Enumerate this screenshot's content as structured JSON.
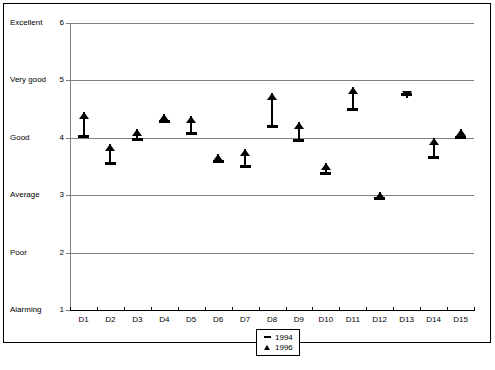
{
  "chart_data": {
    "type": "scatter",
    "title": "",
    "xlabel": "",
    "ylabel": "",
    "ylim": [
      1,
      6
    ],
    "xlim_categories": 15,
    "grid": true,
    "legend_position": "bottom-center",
    "y_ticks": [
      1,
      2,
      3,
      4,
      5,
      6
    ],
    "y_tick_labels": [
      "1",
      "2",
      "3",
      "4",
      "5",
      "6"
    ],
    "y_category_labels": [
      {
        "value": 6,
        "label": "Excellent"
      },
      {
        "value": 5,
        "label": "Very good"
      },
      {
        "value": 4,
        "label": "Good"
      },
      {
        "value": 3,
        "label": "Average"
      },
      {
        "value": 2,
        "label": "Poor"
      },
      {
        "value": 1,
        "label": "Alarming"
      }
    ],
    "categories": [
      "D1",
      "D2",
      "D3",
      "D4",
      "D5",
      "D6",
      "D7",
      "D8",
      "D9",
      "D10",
      "D11",
      "D12",
      "D13",
      "D14",
      "D15"
    ],
    "series": [
      {
        "name": "1994",
        "marker": "dash",
        "values": [
          4.02,
          3.55,
          3.97,
          4.28,
          4.08,
          3.58,
          3.5,
          4.2,
          3.96,
          3.38,
          4.5,
          2.95,
          4.76,
          3.65,
          4.0
        ]
      },
      {
        "name": "1996",
        "marker": "triangle",
        "values": [
          4.45,
          3.9,
          4.15,
          4.42,
          4.38,
          3.72,
          3.8,
          4.78,
          4.28,
          3.57,
          4.88,
          3.05,
          4.7,
          4.0,
          4.15
        ]
      }
    ],
    "legend": [
      {
        "label": "1994",
        "key": "dash-marker-icon"
      },
      {
        "label": "1996",
        "key": "triangle-marker-icon"
      }
    ],
    "colors": {
      "marker": "#000000",
      "gridline": "#808080",
      "axis": "#000000",
      "frame": "#000000",
      "background": "#ffffff"
    }
  }
}
